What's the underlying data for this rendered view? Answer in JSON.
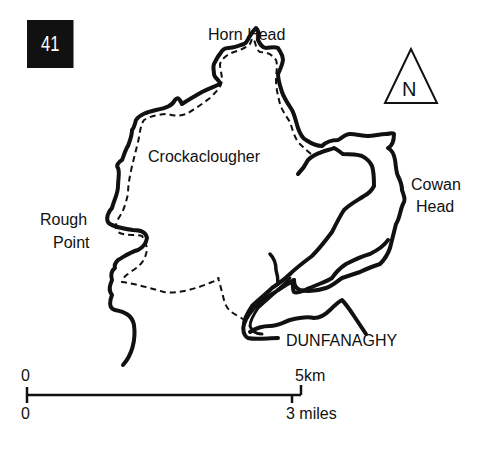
{
  "map": {
    "route_number": "41",
    "north_label": "N",
    "places": {
      "horn_head": "Horn Head",
      "crockaclougher": "Crockaclougher",
      "cowan_head_1": "Cowan",
      "cowan_head_2": "Head",
      "rough_point_1": "Rough",
      "rough_point_2": "Point",
      "dunfanaghy": "DUNFANAGHY"
    },
    "scale": {
      "km_zero": "0",
      "km_end": "5km",
      "miles_zero": "0",
      "miles_end": "3 miles"
    },
    "legend_styles": {
      "coastline": "solid",
      "route": "dashed"
    },
    "colors": {
      "ink": "#111111",
      "paper": "#ffffff"
    }
  }
}
